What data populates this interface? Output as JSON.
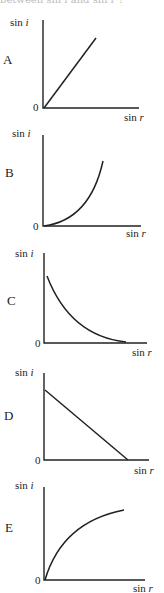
{
  "caption": "between sin i and sin r ?",
  "graphs": [
    {
      "letter": "A",
      "ylabel": "sin i",
      "xlabel": "sin r",
      "origin": "0",
      "shape": "straight line through origin, increasing"
    },
    {
      "letter": "B",
      "ylabel": "sin i",
      "xlabel": "sin r",
      "origin": "0",
      "shape": "curve through origin, increasing, concave up"
    },
    {
      "letter": "C",
      "ylabel": "sin i",
      "xlabel": "sin r",
      "origin": "0",
      "shape": "curve decreasing, concave up"
    },
    {
      "letter": "D",
      "ylabel": "sin i",
      "xlabel": "sin r",
      "origin": "0",
      "shape": "straight line decreasing"
    },
    {
      "letter": "E",
      "ylabel": "sin i",
      "xlabel": "sin r",
      "origin": "0",
      "shape": "curve through origin, increasing, concave down"
    }
  ],
  "labels": {
    "sin": "sin ",
    "i": "i",
    "r": "r"
  }
}
